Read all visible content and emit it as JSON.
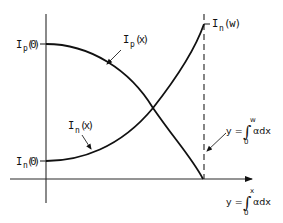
{
  "diagram": {
    "type": "carrier-current-profile",
    "labels": {
      "ip0": {
        "main": "I",
        "sub": "p",
        "arg": "(0)"
      },
      "in0": {
        "main": "I",
        "sub": "n",
        "arg": "(0)"
      },
      "ipx": {
        "main": "I",
        "sub": "p",
        "arg": "(x)"
      },
      "inx": {
        "main": "I",
        "sub": "n",
        "arg": "(x)"
      },
      "inw": {
        "main": "I",
        "sub": "n",
        "arg": "(w)"
      },
      "eq_w": {
        "lhs": "y =",
        "integral": "∫",
        "upper": "w",
        "lower": "0",
        "integrand": "αdx"
      },
      "eq_x": {
        "lhs": "y =",
        "integral": "∫",
        "upper": "x",
        "lower": "0",
        "integrand": "αdx"
      }
    },
    "curves": [
      {
        "name": "Ip(x)",
        "description": "decreasing from Ip(0) at y-axis to zero at x = w"
      },
      {
        "name": "In(x)",
        "description": "increasing from In(0) at y-axis to In(w) at x = w"
      }
    ],
    "colors": {
      "ink": "#111111",
      "background": "#ffffff"
    }
  }
}
